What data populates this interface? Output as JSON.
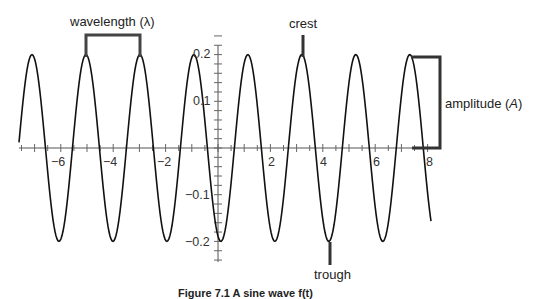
{
  "chart_data": {
    "type": "line",
    "title": "",
    "xlabel": "",
    "ylabel": "",
    "function": "sinusoid y = 0.2 * sin(k x + phi)",
    "amplitude": 0.2,
    "wavelength": 2.06,
    "xlim": [
      -7.6,
      8.1
    ],
    "ylim": [
      -0.24,
      0.24
    ],
    "x_ticks": [
      -6,
      -4,
      -2,
      2,
      4,
      6,
      8
    ],
    "y_ticks": [
      0.2,
      0.1,
      -0.1,
      -0.2
    ],
    "crest_x": [
      -7.1,
      -5.05,
      -2.95,
      -0.9,
      1.15,
      3.2,
      5.3,
      7.35
    ],
    "trough_x": [
      -6.1,
      -4.0,
      -1.95,
      0.1,
      2.15,
      4.3,
      6.35
    ],
    "grid": false,
    "legend": null
  },
  "axes": {
    "x_tick_labels": [
      "−6",
      "−4",
      "−2",
      "2",
      "4",
      "6",
      "8"
    ],
    "y_tick_labels": [
      "0.2",
      "0.1",
      "−0.1",
      "−0.2"
    ]
  },
  "annotations": {
    "wavelength": "wavelength (λ)",
    "crest": "crest",
    "amplitude_prefix": "amplitude (",
    "amplitude_symbol": "A",
    "amplitude_suffix": ")",
    "trough": "trough"
  },
  "caption": "Figure 7.1  A sine wave f(t)",
  "colors": {
    "curve": "#111111",
    "annotation": "#333333",
    "axis": "#444444"
  }
}
